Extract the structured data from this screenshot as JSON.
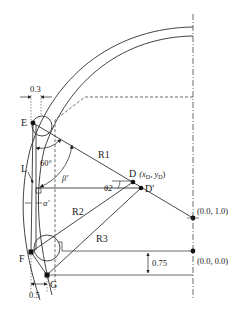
{
  "diagram": {
    "type": "geometry-schematic",
    "colors": {
      "stroke": "#333333",
      "background": "#ffffff",
      "points": "#111111"
    },
    "points": {
      "E": {
        "label": "E"
      },
      "F": {
        "label": "F"
      },
      "G": {
        "label": "G"
      },
      "L": {
        "label": "L"
      },
      "D": {
        "label": "D",
        "coord_label": "(x",
        "sub_x": "D",
        "comma": ", y",
        "sub_y": "D",
        "close": ")"
      },
      "D_prime": {
        "label": "D'"
      },
      "origin_top": {
        "label": "(0.0, 1.0)"
      },
      "origin_bottom": {
        "label": "(0.0, 0.0)"
      }
    },
    "radii": {
      "R1": "R1",
      "R2": "R2",
      "R3": "R3"
    },
    "angles": {
      "sixty": "60°",
      "beta": "β'",
      "alpha": "α'",
      "theta2": "θ2"
    },
    "dimensions": {
      "top_gap": "0.3",
      "bottom_gap": "0.5",
      "vertical_gap": "0.75"
    }
  }
}
